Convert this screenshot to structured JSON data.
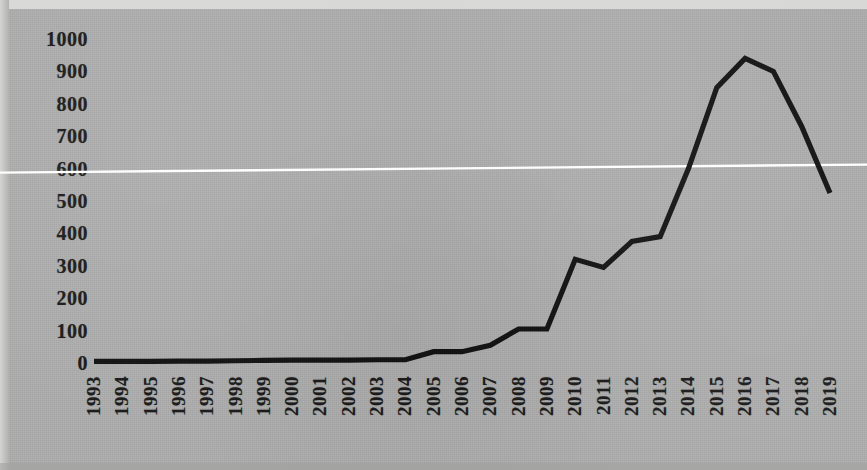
{
  "figure": {
    "background_color": "#ababab",
    "line_color": "#141414",
    "gridline_color": "#ffffff",
    "label_color": "#1c1c1c"
  },
  "chart_data": {
    "type": "line",
    "title": "",
    "subtitle": "",
    "xlabel": "",
    "ylabel": "",
    "categories": [
      "1993",
      "1994",
      "1995",
      "1996",
      "1997",
      "1998",
      "1999",
      "2000",
      "2001",
      "2002",
      "2003",
      "2004",
      "2005",
      "2006",
      "2007",
      "2008",
      "2009",
      "2010",
      "2011",
      "2012",
      "2013",
      "2014",
      "2015",
      "2016",
      "2017",
      "2018",
      "2019"
    ],
    "values": [
      5,
      5,
      5,
      6,
      6,
      7,
      8,
      9,
      9,
      9,
      10,
      10,
      35,
      35,
      55,
      105,
      105,
      320,
      295,
      375,
      390,
      600,
      850,
      940,
      900,
      730,
      525
    ],
    "series": [
      {
        "name": "series-1",
        "values": [
          5,
          5,
          5,
          6,
          6,
          7,
          8,
          9,
          9,
          9,
          10,
          10,
          35,
          35,
          55,
          105,
          105,
          320,
          295,
          375,
          390,
          600,
          850,
          940,
          900,
          730,
          525
        ]
      }
    ],
    "ylim": [
      0,
      1000
    ],
    "ytick_labels": [
      "1000",
      "900",
      "800",
      "700",
      "600",
      "500",
      "400",
      "300",
      "200",
      "100",
      "0"
    ],
    "ytick_values": [
      1000,
      900,
      800,
      700,
      600,
      500,
      400,
      300,
      200,
      100,
      0
    ],
    "xtick_labels": [
      "1993",
      "1994",
      "1995",
      "1996",
      "1997",
      "1998",
      "1999",
      "2000",
      "2001",
      "2002",
      "2003",
      "2004",
      "2005",
      "2006",
      "2007",
      "2008",
      "2009",
      "2010",
      "2011",
      "2012",
      "2013",
      "2014",
      "2015",
      "2016",
      "2017",
      "2018",
      "2019"
    ],
    "xtick_rotation": 90,
    "grid": false,
    "gridlines_horizontal": [
      600
    ],
    "legend": [],
    "legend_position": "none",
    "annotations": []
  }
}
